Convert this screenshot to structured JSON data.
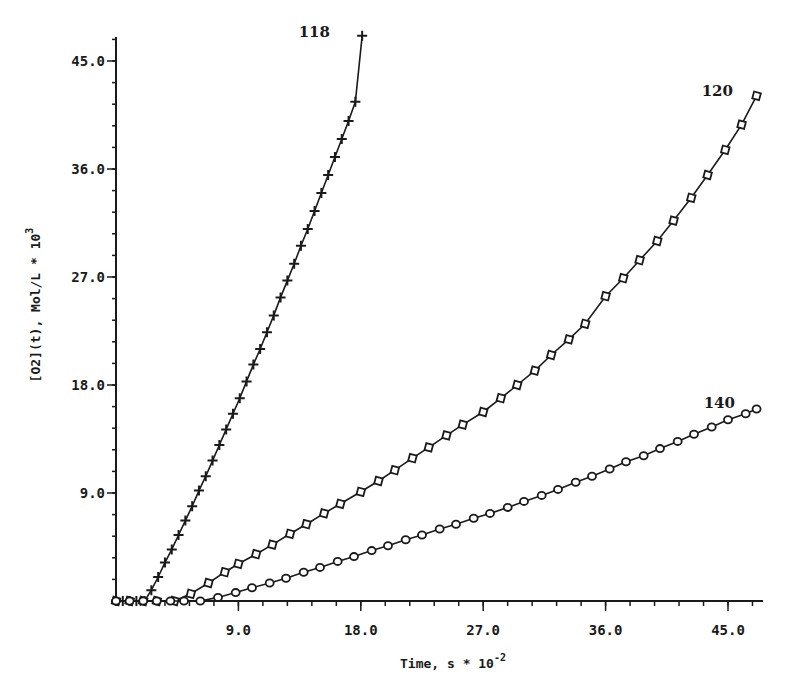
{
  "chart_data": {
    "type": "line",
    "title": "",
    "xlabel": "Time, s * 10^-2",
    "xlabel_main": "Time, s * 10",
    "xlabel_exp": "-2",
    "ylabel": "[O2](t), Mol/L * 10^3",
    "ylabel_main": "[O2](t), Mol/L * 10",
    "ylabel_exp": "3",
    "xlim": [
      0,
      47.5
    ],
    "ylim": [
      0,
      47.5
    ],
    "x_ticks": [
      "9.0",
      "18.0",
      "27.0",
      "36.0",
      "45.0"
    ],
    "x_tick_values": [
      9,
      18,
      27,
      36,
      45
    ],
    "y_ticks": [
      "9.0",
      "18.0",
      "27.0",
      "36.0",
      "45.0"
    ],
    "y_tick_values": [
      9,
      18,
      27,
      36,
      45
    ],
    "minor_ticks_per_major": 5,
    "grid": false,
    "legend": "none (curves labeled inline)",
    "series": [
      {
        "name": "118",
        "marker": "plus",
        "x": [
          0,
          0.5,
          1.0,
          1.5,
          2.1,
          2.6,
          3.1,
          3.6,
          4.1,
          4.6,
          5.1,
          5.6,
          6.1,
          6.6,
          7.1,
          7.6,
          8.1,
          8.6,
          9.1,
          9.6,
          10.1,
          10.6,
          11.1,
          11.6,
          12.1,
          12.6,
          13.1,
          13.6,
          14.1,
          14.6,
          15.1,
          15.6,
          16.1,
          16.6,
          17.1,
          17.6,
          18.1
        ],
        "y": [
          0,
          0,
          0,
          0,
          0.0,
          0.9,
          2.0,
          3.2,
          4.3,
          5.5,
          6.7,
          7.9,
          9.2,
          10.4,
          11.7,
          13.0,
          14.3,
          15.6,
          16.9,
          18.3,
          19.7,
          21.0,
          22.4,
          23.8,
          25.3,
          26.7,
          28.1,
          29.6,
          31.0,
          32.5,
          34.0,
          35.5,
          37.0,
          38.5,
          40.0,
          41.6,
          47.1
        ]
      },
      {
        "name": "120",
        "marker": "square",
        "x": [
          0,
          1.0,
          2.0,
          3.0,
          4.3,
          5.5,
          6.8,
          8.0,
          9.0,
          10.3,
          11.5,
          12.8,
          14.0,
          15.3,
          16.5,
          18.0,
          19.3,
          20.5,
          21.8,
          23.0,
          24.3,
          25.5,
          27.0,
          28.3,
          29.5,
          30.8,
          32.0,
          33.3,
          34.5,
          36.0,
          37.3,
          38.5,
          39.8,
          41.0,
          42.3,
          43.5,
          44.8,
          46.0,
          47.1
        ],
        "y": [
          0,
          0,
          0,
          0,
          0.0,
          0.6,
          1.5,
          2.4,
          3.1,
          3.9,
          4.7,
          5.6,
          6.4,
          7.3,
          8.1,
          9.1,
          10.0,
          10.9,
          11.9,
          12.8,
          13.8,
          14.7,
          15.75,
          16.9,
          18.0,
          19.2,
          20.5,
          21.8,
          23.1,
          25.4,
          26.9,
          28.4,
          30.0,
          31.7,
          33.6,
          35.5,
          37.6,
          39.7,
          42.1
        ]
      },
      {
        "name": "140",
        "marker": "diamond",
        "x": [
          0,
          1.0,
          2.0,
          3.0,
          4.0,
          5.0,
          6.2,
          7.5,
          8.8,
          10.0,
          11.3,
          12.5,
          13.8,
          15.0,
          16.3,
          17.5,
          18.8,
          20.0,
          21.3,
          22.5,
          23.8,
          25.0,
          26.3,
          27.5,
          28.8,
          30.0,
          31.3,
          32.5,
          33.8,
          35.0,
          36.3,
          37.5,
          38.8,
          40.0,
          41.3,
          42.5,
          43.8,
          45.0,
          46.3,
          47.1
        ],
        "y": [
          0,
          0,
          0,
          0,
          0,
          0,
          0.0,
          0.3,
          0.7,
          1.1,
          1.5,
          1.9,
          2.4,
          2.8,
          3.3,
          3.7,
          4.2,
          4.6,
          5.1,
          5.5,
          6.0,
          6.4,
          6.9,
          7.3,
          7.8,
          8.3,
          8.8,
          9.3,
          9.9,
          10.4,
          11.0,
          11.6,
          12.1,
          12.7,
          13.3,
          13.9,
          14.5,
          15.1,
          15.6,
          16.0
        ]
      }
    ],
    "annotations": [
      {
        "text": "118",
        "near_series": "118",
        "position": "end"
      },
      {
        "text": "120",
        "near_series": "120",
        "position": "end"
      },
      {
        "text": "140",
        "near_series": "140",
        "position": "end"
      }
    ],
    "colors": {
      "ink": "#1a1a1a",
      "background": "#ffffff"
    }
  }
}
